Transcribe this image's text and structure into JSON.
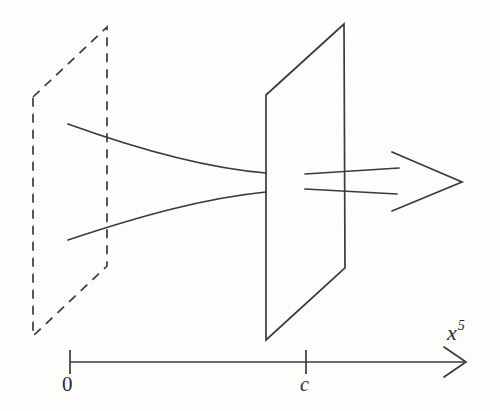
{
  "figure": {
    "domain": "Diagram",
    "caption_text": "",
    "background_color": "#fdfdfb",
    "ink_color": "#3a3a3a",
    "axis": {
      "name": "x5-axis",
      "label": "x",
      "label_superscript": "5",
      "label_full": "x⁵",
      "line": {
        "x1": 70,
        "y1": 362,
        "x2": 465,
        "y2": 362
      },
      "arrow_head": {
        "x": 465,
        "y": 362,
        "style": "open-v"
      },
      "ticks": [
        {
          "name": "tick-0",
          "label": "0",
          "x": 70,
          "label_x": 62,
          "label_y": 372,
          "italic": false
        },
        {
          "name": "tick-c",
          "label": "c",
          "x": 306,
          "label_x": 300,
          "label_y": 373,
          "italic": true
        }
      ]
    },
    "planes": [
      {
        "name": "dashed-plane",
        "style": "dashed",
        "description": "hidden brane at x5 = 0",
        "points": "33,97 107,27 107,266 33,336"
      },
      {
        "name": "solid-plane",
        "style": "solid",
        "description": "brane at x5 = c",
        "points": "266,95 344,24 345,268 266,340"
      }
    ],
    "curves": [
      {
        "name": "upper-throat-curve",
        "description": "upper warped flux line narrowing toward the brane",
        "path": "M 68,124 C 140,150 205,168 266,173"
      },
      {
        "name": "lower-throat-curve",
        "description": "lower warped flux line narrowing toward the brane",
        "path": "M 68,240 C 140,216 205,198 266,192"
      }
    ],
    "arrow": {
      "name": "flux-arrow",
      "description": "hollow block arrow pointing along positive x5",
      "shaft_top": {
        "x1": 305,
        "y1": 174,
        "x2": 397,
        "y2": 168
      },
      "shaft_bottom": {
        "x1": 305,
        "y1": 189,
        "x2": 395,
        "y2": 193
      },
      "head_points": "392,152 462,182 392,211 402,182"
    }
  }
}
